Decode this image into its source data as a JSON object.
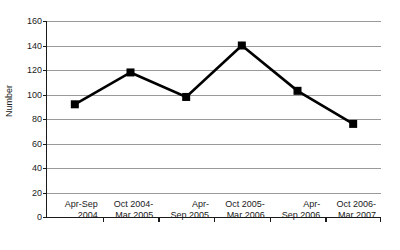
{
  "chart_data": {
    "type": "line",
    "title": "",
    "xlabel": "",
    "ylabel": "Number",
    "categories": [
      "Apr-Sep 2004",
      "Oct 2004-Mar 2005",
      "Apr-Sep 2005",
      "Oct 2005-Mar 2006",
      "Apr-Sep 2006",
      "Oct 2006-Mar 2007"
    ],
    "category_lines": [
      [
        "Apr-Sep",
        "2004"
      ],
      [
        "Oct 2004-",
        "Mar 2005"
      ],
      [
        "Apr-",
        "Sep 2005"
      ],
      [
        "Oct 2005-",
        "Mar 2006"
      ],
      [
        "Apr-",
        "Sep 2006"
      ],
      [
        "Oct 2006-",
        "Mar 2007"
      ]
    ],
    "values": [
      92,
      118,
      98,
      140,
      103,
      76
    ],
    "ylim": [
      0,
      160
    ],
    "ytick_values": [
      0,
      20,
      40,
      60,
      80,
      100,
      120,
      140,
      160
    ],
    "ytick_labels": [
      "0",
      "20",
      "40",
      "60",
      "80",
      "100",
      "120",
      "140",
      "160"
    ],
    "grid": true,
    "legend": "none",
    "line_color": "#000000",
    "marker_color": "#000000",
    "marker_shape": "square",
    "grid_color": "#9a9a9a",
    "axis_color": "#1a1a1a",
    "background": "#ffffff"
  }
}
